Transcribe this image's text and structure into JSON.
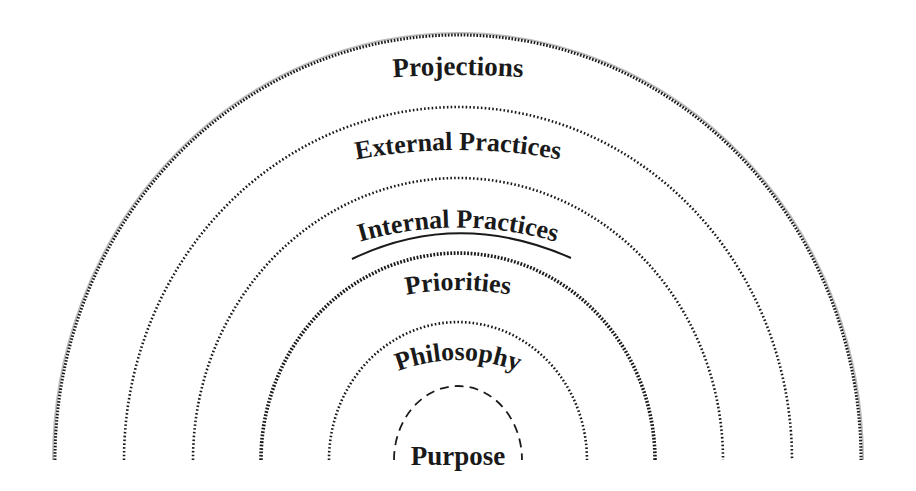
{
  "diagram": {
    "type": "concentric-semicircles",
    "rings": [
      {
        "label": "Projections",
        "line_style": "dotted-double",
        "underlined": false
      },
      {
        "label": "External Practices",
        "line_style": "dotted",
        "underlined": false
      },
      {
        "label": "Internal Practices",
        "line_style": "dotted",
        "underlined": true
      },
      {
        "label": "Priorities",
        "line_style": "dotted-heavy",
        "underlined": false
      },
      {
        "label": "Philosophy",
        "line_style": "dotted",
        "underlined": false
      },
      {
        "label": "Purpose",
        "line_style": "dashed",
        "underlined": false
      }
    ],
    "colors": {
      "line": "#1a1a1a",
      "text": "#1a1a1a",
      "outer_shadow": "#bdbdbd",
      "background": "#ffffff"
    }
  }
}
